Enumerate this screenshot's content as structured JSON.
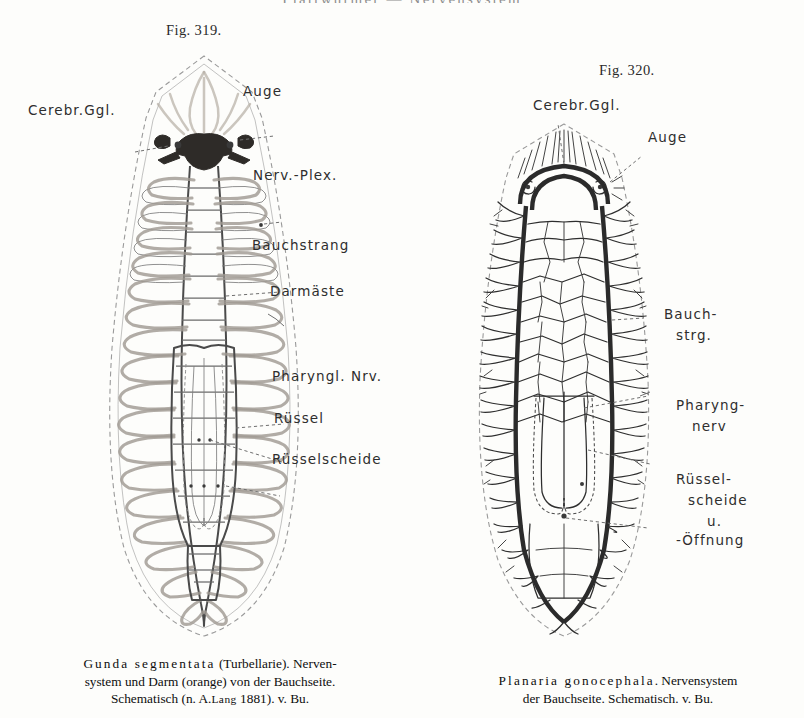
{
  "page": {
    "running_head": "Plattwürmer — Nervensystem"
  },
  "figures": [
    {
      "id": "fig-319",
      "number": "Fig. 319.",
      "labels": [
        {
          "name": "cerebr-ggl",
          "text": "Cerebr.Ggl."
        },
        {
          "name": "auge",
          "text": "Auge"
        },
        {
          "name": "nerv-plex",
          "text": "Nerv.-Plex."
        },
        {
          "name": "bauchstrang",
          "text": "Bauchstrang"
        },
        {
          "name": "darmaeste",
          "text": "Darmäste"
        },
        {
          "name": "pharyngl-nrv",
          "text": "Pharyngl. Nrv."
        },
        {
          "name": "ruessel",
          "text": "Rüssel"
        },
        {
          "name": "ruesselscheide",
          "text": "Rüsselscheide"
        }
      ],
      "caption": {
        "line1_species": "Gunda segmentata",
        "line1_rest": " (Turbellarie).  Nerven-",
        "line2": "system und Darm (orange) von der Bauchseite.",
        "line3_a": "Schematisch (n. ",
        "line3_author_initial": "A.",
        "line3_author": "Lang",
        "line3_b": " 1881).  v. Bu."
      }
    },
    {
      "id": "fig-320",
      "number": "Fig. 320.",
      "labels": [
        {
          "name": "cerebr-ggl",
          "text": "Cerebr.Ggl."
        },
        {
          "name": "auge",
          "text": "Auge"
        },
        {
          "name": "bauchstrg-line1",
          "text": "Bauch-"
        },
        {
          "name": "bauchstrg-line2",
          "text": "strg."
        },
        {
          "name": "pharyngnerv-line1",
          "text": "Pharyng-"
        },
        {
          "name": "pharyngnerv-line2",
          "text": "nerv"
        },
        {
          "name": "ruesselscheide-line1",
          "text": "Rüssel-"
        },
        {
          "name": "ruesselscheide-line2",
          "text": "scheide"
        },
        {
          "name": "ruesselscheide-line3",
          "text": "u."
        },
        {
          "name": "oeffnung",
          "text": "-Öffnung"
        }
      ],
      "caption": {
        "line1_species": "Planaria gonocephala",
        "line1_rest": ". Nervensystem",
        "line2": "der Bauchseite.  Schematisch.  v. Bu."
      }
    }
  ],
  "colors": {
    "page_background": "#fdfdfb",
    "ink": "#1a1a1a",
    "gut_orange": "#a09a92",
    "nerve_dark": "#2b2b2b",
    "outline_gray": "#9a9a9a"
  }
}
